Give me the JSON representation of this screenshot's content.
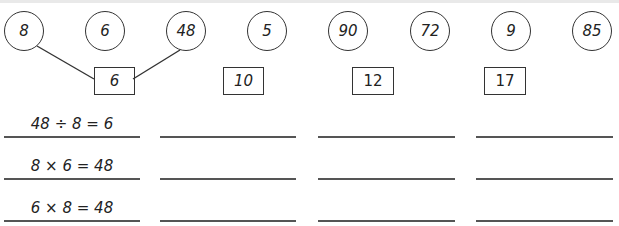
{
  "worksheet": {
    "circles": [
      "8",
      "6",
      "48",
      "5",
      "90",
      "72",
      "9",
      "85"
    ],
    "boxes": [
      "6",
      "10",
      "12",
      "17"
    ],
    "answer_columns": [
      {
        "equations": [
          "48 ÷ 8 = 6",
          "8 × 6 = 48",
          "6 × 8 = 48"
        ]
      },
      {
        "equations": [
          "",
          "",
          ""
        ]
      },
      {
        "equations": [
          "",
          "",
          ""
        ]
      },
      {
        "equations": [
          "",
          "",
          ""
        ]
      }
    ]
  }
}
